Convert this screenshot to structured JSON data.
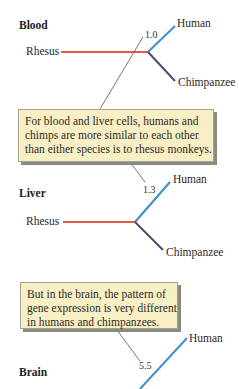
{
  "colors": {
    "rhesus": "#e8554a",
    "human": "#3f8fd0",
    "chimpanzee": "#4d4a6e",
    "callout_line": "#555555",
    "note_bg": "#f8f0c4"
  },
  "sections": [
    {
      "title": "Blood",
      "distance": "1.0",
      "labels": {
        "rhesus": "Rhesus",
        "human": "Human",
        "chimpanzee": "Chimpanzee"
      }
    },
    {
      "title": "Liver",
      "distance": "1.3",
      "labels": {
        "rhesus": "Rhesus",
        "human": "Human",
        "chimpanzee": "Chimpanzee"
      }
    },
    {
      "title": "Brain",
      "distance": "5.5",
      "labels": {
        "human": "Human"
      }
    }
  ],
  "notes": [
    {
      "lines": [
        "For blood and liver cells, humans and",
        "chimps are more similar to each other",
        "than either species is to rhesus monkeys."
      ]
    },
    {
      "lines": [
        "But in the brain, the pattern of",
        "gene expression is very different",
        "in humans and chimpanzees."
      ]
    }
  ]
}
